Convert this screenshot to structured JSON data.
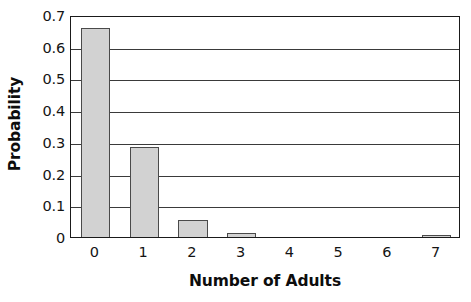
{
  "chart_data": {
    "type": "bar",
    "title": "",
    "subtitle": "",
    "xlabel": "Number of Adults",
    "ylabel": "Probability",
    "categories": [
      "0",
      "1",
      "2",
      "3",
      "4",
      "5",
      "6",
      "7"
    ],
    "values": [
      0.66,
      0.285,
      0.055,
      0.012,
      0.0,
      0.0,
      0.0,
      0.005
    ],
    "series": [
      {
        "name": "Probability",
        "values": [
          0.66,
          0.285,
          0.055,
          0.012,
          0.0,
          0.0,
          0.0,
          0.005
        ]
      }
    ],
    "xlim": [
      -0.5,
      7.5
    ],
    "ylim": [
      0,
      0.7
    ],
    "ytick_labels": [
      "0.7",
      "0.6",
      "0.5",
      "0.4",
      "0.3",
      "0.2",
      "0.1",
      "0"
    ],
    "ytick_values": [
      0.7,
      0.6,
      0.5,
      0.4,
      0.3,
      0.2,
      0.1,
      0
    ],
    "xtick_labels": [
      "0",
      "1",
      "2",
      "3",
      "4",
      "5",
      "6",
      "7"
    ],
    "grid": "horizontal",
    "legend": "none",
    "annotations": [],
    "bar_fill_color": "#d2d2d2",
    "bar_edge_color": "#4a4a4a",
    "axis_color": "#1a1a1a",
    "gridline_color": "#3a3a3a",
    "background_color": "#ffffff",
    "text_color": "#141414"
  }
}
